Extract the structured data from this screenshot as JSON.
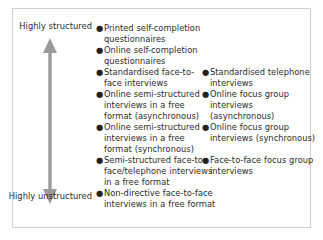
{
  "figure": {
    "axis": {
      "name": "structure-continuum",
      "top_label": "Highly structured",
      "bottom_label": "Highly unstructured",
      "arrow_icon": "double-headed-vertical-arrow-icon",
      "arrow_color": "#9a9a9a"
    },
    "colors": {
      "text": "#2b2b2b",
      "border": "#cfcfcf",
      "background": "#ffffff",
      "bullet": "#222222"
    },
    "bullet_glyph": "●",
    "columns": [
      {
        "name": "column-one",
        "items": [
          "Printed self-completion questionnaires",
          "Online self-completion questionnaires",
          "Standardised face-to-face interviews",
          "Online semi-structured interviews in a free format (asynchronous)",
          "Online semi-structured interviews in a free format (synchronous)",
          "Semi-structured face-to-face/telephone interviews in a free format",
          "Non-directive face-to-face interviews in a free format"
        ],
        "offsets_px": [
          14,
          36,
          58,
          80,
          113,
          146,
          179
        ]
      },
      {
        "name": "column-two",
        "items": [
          "Standardised telephone interviews",
          "Online focus group interviews (asynchronous)",
          "Online focus group interviews (synchronous)",
          "Face-to-face focus group interviews"
        ],
        "offsets_px": [
          58,
          80,
          113,
          146
        ]
      }
    ]
  }
}
